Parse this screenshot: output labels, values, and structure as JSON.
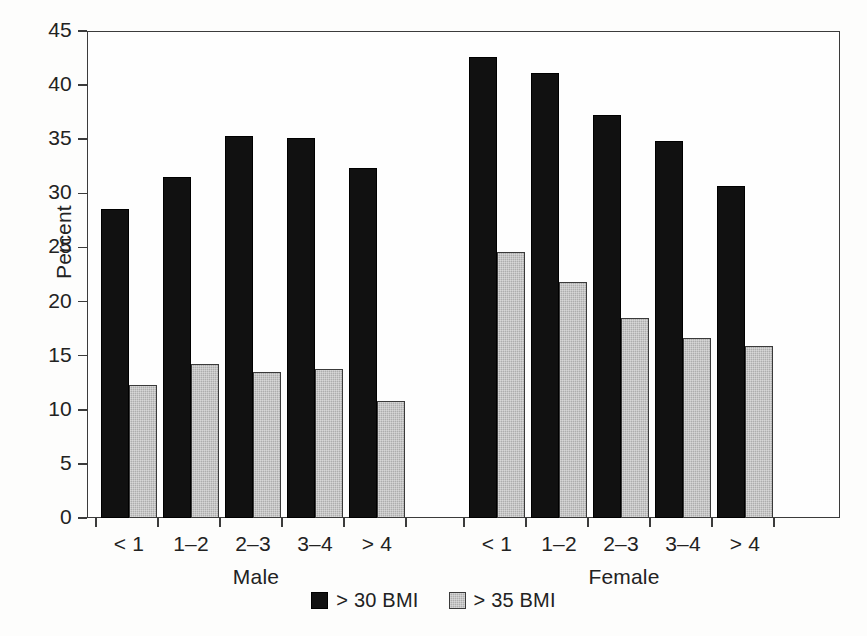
{
  "chart_data": {
    "type": "bar",
    "title": "",
    "xlabel": "",
    "ylabel": "Percent",
    "ylim": [
      0,
      45
    ],
    "yticks": [
      0,
      5,
      10,
      15,
      20,
      25,
      30,
      35,
      40,
      45
    ],
    "grid": false,
    "legend_position": "bottom-center",
    "categories": [
      "< 1",
      "1–2",
      "2–3",
      "3–4",
      "> 4"
    ],
    "groups": [
      {
        "name": "Male",
        "series": [
          {
            "name": "> 30 BMI",
            "values": [
              28.6,
              31.5,
              35.3,
              35.1,
              32.3
            ]
          },
          {
            "name": "> 35 BMI",
            "values": [
              12.3,
              14.2,
              13.5,
              13.8,
              10.8
            ]
          }
        ]
      },
      {
        "name": "Female",
        "series": [
          {
            "name": "> 30 BMI",
            "values": [
              42.6,
              41.1,
              37.2,
              34.8,
              30.7
            ]
          },
          {
            "name": "> 35 BMI",
            "values": [
              24.6,
              21.8,
              18.5,
              16.6,
              15.9
            ]
          }
        ]
      }
    ],
    "legend": [
      {
        "label": "> 30 BMI",
        "color": "#111111",
        "style": "dark"
      },
      {
        "label": "> 35 BMI",
        "color": "#adadad",
        "style": "light"
      }
    ],
    "colors": {
      "series_30_bmi": "#111111",
      "series_35_bmi": "#adadad",
      "axis": "#3b3b3b",
      "background": "#ffffff"
    }
  }
}
